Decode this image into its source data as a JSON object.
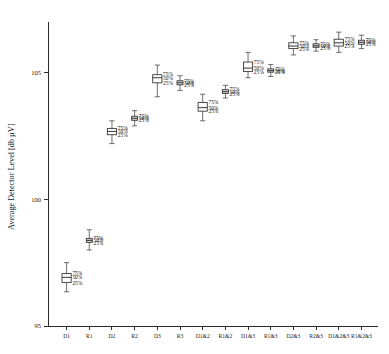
{
  "chart_data": {
    "type": "box",
    "title": "",
    "xlabel": "",
    "ylabel": "Average Detector Level [db µV]",
    "ylim": [
      95,
      107
    ],
    "yticks": [
      95,
      100,
      105
    ],
    "ytick_labels": [
      "95",
      "100",
      "105"
    ],
    "grid": false,
    "legend": "none",
    "percentile_labels": [
      "75%",
      "50%",
      "25%"
    ],
    "categories": [
      "D1",
      "R1",
      "D2",
      "R2",
      "D3",
      "R3",
      "D1&2",
      "R1&2",
      "D1&3",
      "R1&3",
      "D2&3",
      "R2&3",
      "D1&2&3",
      "R1&2&3"
    ],
    "boxes": [
      {
        "category": "D1",
        "whisker_low": 96.35,
        "q1": 96.72,
        "median": 96.92,
        "q3": 97.07,
        "whisker_high": 97.5,
        "style": "open",
        "labels_shown": true
      },
      {
        "category": "R1",
        "whisker_low": 98.0,
        "q1": 98.3,
        "median": 98.38,
        "q3": 98.46,
        "whisker_high": 98.8,
        "style": "gray",
        "labels_shown": true
      },
      {
        "category": "D2",
        "whisker_low": 102.2,
        "q1": 102.55,
        "median": 102.68,
        "q3": 102.8,
        "whisker_high": 103.1,
        "style": "open",
        "labels_shown": true
      },
      {
        "category": "R2",
        "whisker_low": 102.9,
        "q1": 103.12,
        "median": 103.2,
        "q3": 103.28,
        "whisker_high": 103.5,
        "style": "gray",
        "labels_shown": true
      },
      {
        "category": "D3",
        "whisker_low": 104.05,
        "q1": 104.6,
        "median": 104.8,
        "q3": 104.92,
        "whisker_high": 105.3,
        "style": "open",
        "labels_shown": true
      },
      {
        "category": "R3",
        "whisker_low": 104.3,
        "q1": 104.52,
        "median": 104.6,
        "q3": 104.68,
        "whisker_high": 104.88,
        "style": "gray",
        "labels_shown": true
      },
      {
        "category": "D1&2",
        "whisker_low": 103.1,
        "q1": 103.48,
        "median": 103.62,
        "q3": 103.82,
        "whisker_high": 104.15,
        "style": "open",
        "labels_shown": true
      },
      {
        "category": "R1&2",
        "whisker_low": 104.0,
        "q1": 104.18,
        "median": 104.25,
        "q3": 104.33,
        "whisker_high": 104.5,
        "style": "gray",
        "labels_shown": true
      },
      {
        "category": "D1&3",
        "whisker_low": 104.8,
        "q1": 105.05,
        "median": 105.18,
        "q3": 105.42,
        "whisker_high": 105.8,
        "style": "open",
        "labels_shown": true
      },
      {
        "category": "R1&3",
        "whisker_low": 104.85,
        "q1": 105.02,
        "median": 105.08,
        "q3": 105.15,
        "whisker_high": 105.32,
        "style": "gray",
        "labels_shown": true
      },
      {
        "category": "D2&3",
        "whisker_low": 105.7,
        "q1": 105.95,
        "median": 106.05,
        "q3": 106.18,
        "whisker_high": 106.45,
        "style": "open",
        "labels_shown": true
      },
      {
        "category": "R2&3",
        "whisker_low": 105.85,
        "q1": 106.0,
        "median": 106.06,
        "q3": 106.14,
        "whisker_high": 106.3,
        "style": "gray",
        "labels_shown": true
      },
      {
        "category": "D1&2&3",
        "whisker_low": 105.8,
        "q1": 106.05,
        "median": 106.18,
        "q3": 106.32,
        "whisker_high": 106.6,
        "style": "open",
        "labels_shown": true
      },
      {
        "category": "R1&2&3",
        "whisker_low": 105.95,
        "q1": 106.12,
        "median": 106.2,
        "q3": 106.28,
        "whisker_high": 106.48,
        "style": "gray",
        "labels_shown": true
      }
    ]
  },
  "axes": {
    "y_axis_title": "Average Detector Level [db µV]",
    "y_tick_labels": [
      "105",
      "100",
      "95"
    ],
    "x_tick_labels": [
      "D1",
      "R1",
      "D2",
      "R2",
      "D3",
      "R3",
      "D1&2",
      "R1&2",
      "D1&3",
      "R1&3",
      "D2&3",
      "R2&3",
      "D1&2&3",
      "R1&2&3"
    ]
  },
  "annotations": {
    "upper_quartile": "75%",
    "median": "50%",
    "lower_quartile": "25%"
  },
  "colors": {
    "axis": "#2b2b2b",
    "box_stroke": "#3a3a3a",
    "box_fill_open": "#ffffff",
    "box_fill_gray": "#d9d9d9",
    "text": "#1a1a1a",
    "background": "#ffffff"
  }
}
